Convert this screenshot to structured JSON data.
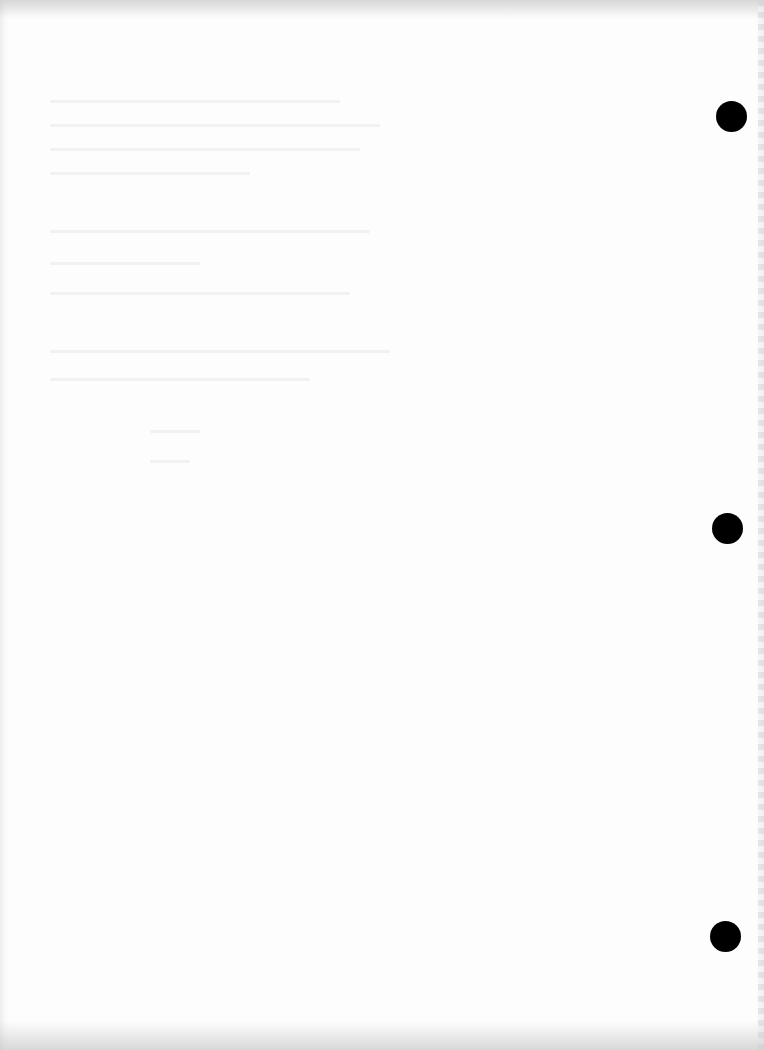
{
  "document": {
    "type": "scanned blank page",
    "text": "",
    "punch_holes": [
      {
        "cx": 731,
        "cy": 116
      },
      {
        "cx": 727,
        "cy": 528
      },
      {
        "cx": 725,
        "cy": 936
      }
    ],
    "hole_color": "#000000",
    "paper_color": "#fdfdfd"
  }
}
